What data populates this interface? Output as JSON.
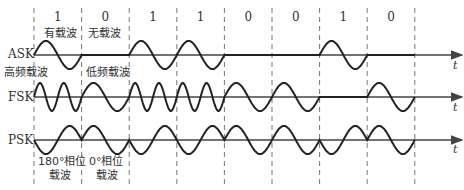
{
  "bits": [
    "1",
    "0",
    "1",
    "1",
    "0",
    "0",
    "1",
    "0"
  ],
  "rows": [
    {
      "label": "ASK",
      "axis_label": "t"
    },
    {
      "label": "FSK",
      "axis_label": "t"
    },
    {
      "label": "PSK",
      "axis_label": "t"
    }
  ],
  "annotations": {
    "ask_carrier": "有载波",
    "ask_no_carrier": "无载波",
    "fsk_high": "高频载波",
    "fsk_low": "低频载波",
    "psk_180_line1": "180°相位",
    "psk_180_line2": "载波",
    "psk_0_line1": "0°相位",
    "psk_0_line2": "载波"
  },
  "colors": {
    "wave": "#222222",
    "axis": "#444444",
    "dash": "#777777",
    "text": "#333333"
  }
}
